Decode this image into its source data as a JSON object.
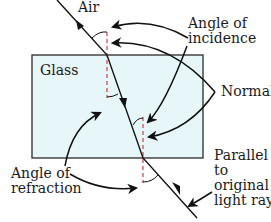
{
  "diagram": {
    "labels": {
      "air": "Air",
      "glass": "Glass",
      "angle_of_incidence": [
        "Angle of",
        "incidence"
      ],
      "normal": "Normal",
      "angle_of_refraction": [
        "Angle of",
        "refraction"
      ],
      "parallel": [
        "Parallel",
        "to",
        "original",
        "light ray."
      ]
    },
    "colors": {
      "glass_fill": "#e6f6f9",
      "glass_border": "#2a2a2a",
      "ray": "#111111",
      "normal_line": "#d2423f"
    }
  }
}
